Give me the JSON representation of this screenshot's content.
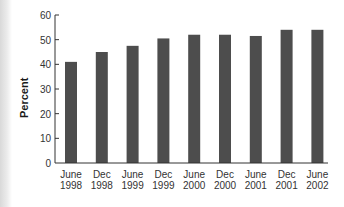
{
  "chart_data": {
    "type": "bar",
    "title": "",
    "xlabel": "",
    "ylabel": "Percent",
    "ylim": [
      0,
      60
    ],
    "yticks": [
      0,
      10,
      20,
      30,
      40,
      50,
      60
    ],
    "grid": false,
    "legend": null,
    "categories": [
      [
        "June",
        "1998"
      ],
      [
        "Dec",
        "1998"
      ],
      [
        "June",
        "1999"
      ],
      [
        "Dec",
        "1999"
      ],
      [
        "June",
        "2000"
      ],
      [
        "Dec",
        "2000"
      ],
      [
        "June",
        "2001"
      ],
      [
        "Dec",
        "2001"
      ],
      [
        "June",
        "2002"
      ]
    ],
    "values": [
      41,
      45,
      47.5,
      50.5,
      52,
      52,
      51.5,
      54,
      54
    ],
    "bar_color": "#4d4d4d",
    "axis_color": "#333333"
  }
}
